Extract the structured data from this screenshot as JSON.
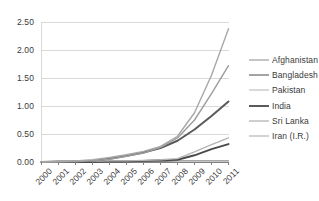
{
  "chart_data": {
    "type": "line",
    "title": "",
    "subtitle": "",
    "xlabel": "",
    "ylabel": "",
    "categories": [
      "2000",
      "2001",
      "2002",
      "2003",
      "2004",
      "2005",
      "2006",
      "2007",
      "2008",
      "2009",
      "2010",
      "2011"
    ],
    "ylim": [
      0.0,
      2.5
    ],
    "ytick_labels": [
      "0.00",
      "0.50",
      "1.00",
      "1.50",
      "2.00",
      "2.50"
    ],
    "ytick_values": [
      0.0,
      0.5,
      1.0,
      1.5,
      2.0,
      2.5
    ],
    "grid": "horizontal",
    "legend_position": "right",
    "series": [
      {
        "name": "Afghanistan",
        "color": "#8c8c8c",
        "width": 1.4,
        "values": [
          0.0,
          0.0,
          0.0,
          0.0,
          0.01,
          0.01,
          0.01,
          0.01,
          0.02,
          0.02,
          0.02,
          0.02
        ]
      },
      {
        "name": "Bangladesh",
        "color": "#4a4a4a",
        "width": 1.9,
        "values": [
          0.0,
          0.0,
          0.0,
          0.0,
          0.01,
          0.01,
          0.02,
          0.03,
          0.04,
          0.12,
          0.23,
          0.32
        ]
      },
      {
        "name": "Pakistan",
        "color": "#b4b4b4",
        "width": 1.3,
        "values": [
          0.0,
          0.0,
          0.01,
          0.01,
          0.02,
          0.02,
          0.03,
          0.04,
          0.06,
          0.18,
          0.31,
          0.43
        ]
      },
      {
        "name": "India",
        "color": "#5a5a5a",
        "width": 2.0,
        "values": [
          0.0,
          0.01,
          0.01,
          0.02,
          0.06,
          0.11,
          0.17,
          0.25,
          0.38,
          0.58,
          0.82,
          1.08
        ]
      },
      {
        "name": "Sri Lanka",
        "color": "#9d9d9d",
        "width": 1.4,
        "values": [
          0.0,
          0.01,
          0.01,
          0.02,
          0.05,
          0.1,
          0.16,
          0.26,
          0.43,
          0.75,
          1.22,
          1.72
        ]
      },
      {
        "name": "Iran (I.R.)",
        "color": "#a8a8a8",
        "width": 1.4,
        "values": [
          0.0,
          0.01,
          0.02,
          0.04,
          0.08,
          0.13,
          0.19,
          0.28,
          0.46,
          0.88,
          1.55,
          2.38
        ]
      }
    ]
  },
  "axis": {
    "line_color": "#808080",
    "grid_color": "#d9d9d9"
  }
}
